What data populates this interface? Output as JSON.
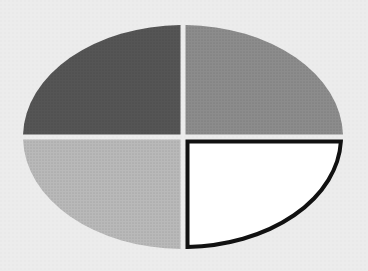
{
  "figure": {
    "type": "quadrant-ellipse",
    "background": "#ececec",
    "center": [
      183,
      137
    ],
    "rx": 160,
    "ry": 112,
    "gap": 5,
    "quadrants": [
      {
        "id": "top-left",
        "fill": "#555555",
        "stroke": "none",
        "stroke_width": 0
      },
      {
        "id": "top-right",
        "fill": "#8c8c8c",
        "stroke": "none",
        "stroke_width": 0
      },
      {
        "id": "bottom-left",
        "fill": "#b9b9b9",
        "stroke": "none",
        "stroke_width": 0
      },
      {
        "id": "bottom-right",
        "fill": "#ffffff",
        "stroke": "#111111",
        "stroke_width": 4
      }
    ]
  }
}
